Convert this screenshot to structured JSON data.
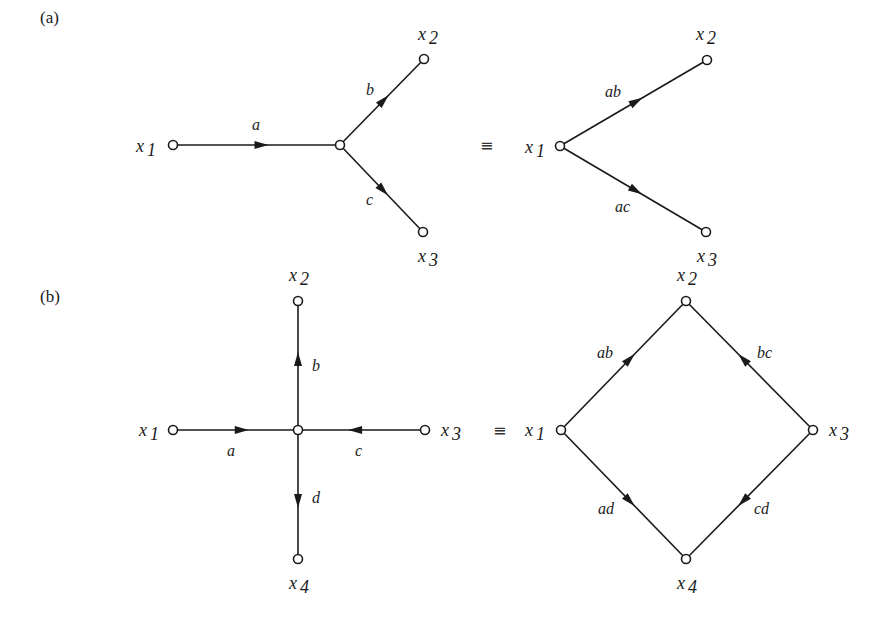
{
  "figure": {
    "background": "#ffffff",
    "ink_color": "#1a1a1a",
    "equivalence_symbol": "≡",
    "parts": [
      {
        "id": "a",
        "label": "(a)",
        "label_pos": [
          40,
          24
        ],
        "equiv_pos": [
          480,
          151
        ],
        "left_graph": {
          "nodes": [
            {
              "id": "x1",
              "name": "x",
              "sub": "1",
              "pos": [
                173,
                145
              ],
              "label_pos": [
                136,
                152
              ]
            },
            {
              "id": "m",
              "name": "",
              "sub": "",
              "pos": [
                340,
                145
              ],
              "label_pos": [
                0,
                0
              ]
            },
            {
              "id": "x2",
              "name": "x",
              "sub": "2",
              "pos": [
                424,
                59
              ],
              "label_pos": [
                418,
                40
              ]
            },
            {
              "id": "x3",
              "name": "x",
              "sub": "3",
              "pos": [
                423,
                232
              ],
              "label_pos": [
                418,
                262
              ]
            }
          ],
          "edges": [
            {
              "from": "x1",
              "to": "m",
              "gain": "a",
              "label_pos": [
                252,
                130
              ],
              "arrow_t": 0.53
            },
            {
              "from": "m",
              "to": "x2",
              "gain": "b",
              "label_pos": [
                366,
                95
              ],
              "arrow_t": 0.52
            },
            {
              "from": "m",
              "to": "x3",
              "gain": "c",
              "label_pos": [
                366,
                205
              ],
              "arrow_t": 0.52
            }
          ]
        },
        "right_graph": {
          "nodes": [
            {
              "id": "x1",
              "name": "x",
              "sub": "1",
              "pos": [
                560,
                146
              ],
              "label_pos": [
                525,
                153
              ]
            },
            {
              "id": "x2",
              "name": "x",
              "sub": "2",
              "pos": [
                707,
                60
              ],
              "label_pos": [
                696,
                40
              ]
            },
            {
              "id": "x3",
              "name": "x",
              "sub": "3",
              "pos": [
                706,
                232
              ],
              "label_pos": [
                697,
                262
              ]
            }
          ],
          "edges": [
            {
              "from": "x1",
              "to": "x2",
              "gain": "ab",
              "label_pos": [
                605,
                97
              ],
              "arrow_t": 0.52
            },
            {
              "from": "x1",
              "to": "x3",
              "gain": "ac",
              "label_pos": [
                615,
                212
              ],
              "arrow_t": 0.52
            }
          ]
        }
      },
      {
        "id": "b",
        "label": "(b)",
        "label_pos": [
          40,
          303
        ],
        "equiv_pos": [
          493,
          436
        ],
        "left_graph": {
          "nodes": [
            {
              "id": "x1",
              "name": "x",
              "sub": "1",
              "pos": [
                173,
                430
              ],
              "label_pos": [
                139,
                436
              ]
            },
            {
              "id": "m",
              "name": "",
              "sub": "",
              "pos": [
                298,
                430
              ],
              "label_pos": [
                0,
                0
              ]
            },
            {
              "id": "x2",
              "name": "x",
              "sub": "2",
              "pos": [
                298,
                301
              ],
              "label_pos": [
                289,
                281
              ]
            },
            {
              "id": "x3",
              "name": "x",
              "sub": "3",
              "pos": [
                425,
                430
              ],
              "label_pos": [
                441,
                436
              ]
            },
            {
              "id": "x4",
              "name": "x",
              "sub": "4",
              "pos": [
                298,
                559
              ],
              "label_pos": [
                289,
                589
              ]
            }
          ],
          "edges": [
            {
              "from": "x1",
              "to": "m",
              "gain": "a",
              "label_pos": [
                227,
                456
              ],
              "arrow_t": 0.55
            },
            {
              "from": "m",
              "to": "x2",
              "gain": "b",
              "label_pos": [
                312,
                371
              ],
              "arrow_t": 0.55
            },
            {
              "from": "x3",
              "to": "m",
              "gain": "c",
              "label_pos": [
                355,
                456
              ],
              "arrow_t": 0.55
            },
            {
              "from": "m",
              "to": "x4",
              "gain": "d",
              "label_pos": [
                312,
                503
              ],
              "arrow_t": 0.55
            }
          ]
        },
        "right_graph": {
          "nodes": [
            {
              "id": "x1",
              "name": "x",
              "sub": "1",
              "pos": [
                561,
                430
              ],
              "label_pos": [
                525,
                436
              ]
            },
            {
              "id": "x2",
              "name": "x",
              "sub": "2",
              "pos": [
                686,
                301
              ],
              "label_pos": [
                677,
                281
              ]
            },
            {
              "id": "x3",
              "name": "x",
              "sub": "3",
              "pos": [
                813,
                430
              ],
              "label_pos": [
                829,
                436
              ]
            },
            {
              "id": "x4",
              "name": "x",
              "sub": "4",
              "pos": [
                686,
                559
              ],
              "label_pos": [
                677,
                589
              ]
            }
          ],
          "edges": [
            {
              "from": "x1",
              "to": "x2",
              "gain": "ab",
              "label_pos": [
                597,
                358
              ],
              "arrow_t": 0.55
            },
            {
              "from": "x3",
              "to": "x2",
              "gain": "bc",
              "label_pos": [
                757,
                358
              ],
              "arrow_t": 0.55
            },
            {
              "from": "x1",
              "to": "x4",
              "gain": "ad",
              "label_pos": [
                598,
                514
              ],
              "arrow_t": 0.55
            },
            {
              "from": "x3",
              "to": "x4",
              "gain": "cd",
              "label_pos": [
                754,
                514
              ],
              "arrow_t": 0.55
            }
          ]
        }
      }
    ]
  }
}
